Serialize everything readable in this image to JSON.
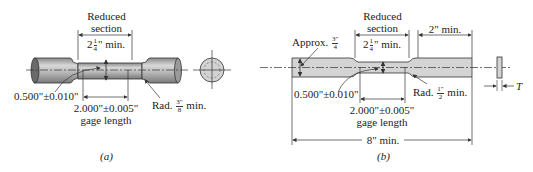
{
  "figure_a": {
    "caption": "(a)",
    "reduced_section_line1": "Reduced",
    "reduced_section_line2": "section",
    "reduced_length_whole": "2",
    "reduced_length_num": "1",
    "reduced_length_den": "4",
    "reduced_length_unit": "\" min.",
    "diameter": "0.500\"±0.010\"",
    "gage_length_value": "2.000\"±0.005\"",
    "gage_length_label": "gage length",
    "radius_prefix": "Rad.",
    "radius_num": "3\"",
    "radius_den": "8",
    "radius_suffix": "min."
  },
  "figure_b": {
    "caption": "(b)",
    "reduced_section_line1": "Reduced",
    "reduced_section_line2": "section",
    "reduced_length_whole": "2",
    "reduced_length_num": "1",
    "reduced_length_den": "4",
    "reduced_length_unit": "\" min.",
    "grip_length": "2\" min.",
    "approx_prefix": "Approx.",
    "approx_num": "3\"",
    "approx_den": "4",
    "width": "0.500\"±0.010\"",
    "gage_length_value": "2.000\"±0.005\"",
    "gage_length_label": "gage length",
    "radius_prefix": "Rad.",
    "radius_num": "1\"",
    "radius_den": "2",
    "radius_suffix": "min.",
    "overall_length": "8\" min.",
    "thickness_label": "T"
  },
  "colors": {
    "specimen_fill": "#c8c8c8",
    "specimen_light": "#e2e2e2",
    "line": "#333333"
  }
}
